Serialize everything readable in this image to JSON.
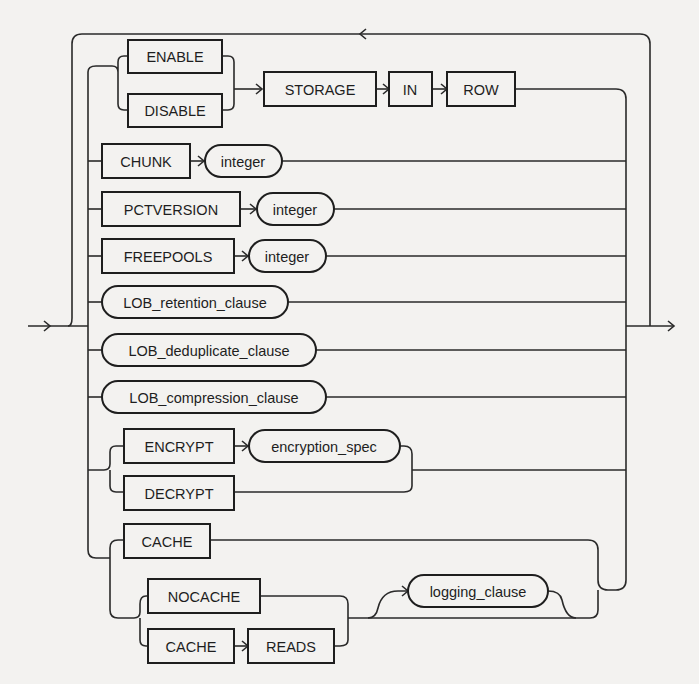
{
  "diagram": {
    "type": "railroad-syntax-diagram",
    "colors": {
      "background": "#f3f2f0",
      "line": "#2a2a2a",
      "text": "#1e1e1e"
    },
    "nodes": {
      "enable": {
        "label": "ENABLE",
        "kind": "keyword"
      },
      "disable": {
        "label": "DISABLE",
        "kind": "keyword"
      },
      "storage": {
        "label": "STORAGE",
        "kind": "keyword"
      },
      "in": {
        "label": "IN",
        "kind": "keyword"
      },
      "row": {
        "label": "ROW",
        "kind": "keyword"
      },
      "chunk": {
        "label": "CHUNK",
        "kind": "keyword"
      },
      "chunk_integer": {
        "label": "integer",
        "kind": "parameter"
      },
      "pctversion": {
        "label": "PCTVERSION",
        "kind": "keyword"
      },
      "pctversion_integer": {
        "label": "integer",
        "kind": "parameter"
      },
      "freepools": {
        "label": "FREEPOOLS",
        "kind": "keyword"
      },
      "freepools_integer": {
        "label": "integer",
        "kind": "parameter"
      },
      "lob_retention_clause": {
        "label": "LOB_retention_clause",
        "kind": "parameter"
      },
      "lob_deduplicate_clause": {
        "label": "LOB_deduplicate_clause",
        "kind": "parameter"
      },
      "lob_compression_clause": {
        "label": "LOB_compression_clause",
        "kind": "parameter"
      },
      "encrypt": {
        "label": "ENCRYPT",
        "kind": "keyword"
      },
      "encryption_spec": {
        "label": "encryption_spec",
        "kind": "parameter"
      },
      "decrypt": {
        "label": "DECRYPT",
        "kind": "keyword"
      },
      "cache": {
        "label": "CACHE",
        "kind": "keyword"
      },
      "nocache": {
        "label": "NOCACHE",
        "kind": "keyword"
      },
      "cache2": {
        "label": "CACHE",
        "kind": "keyword"
      },
      "reads": {
        "label": "READS",
        "kind": "keyword"
      },
      "logging_clause": {
        "label": "logging_clause",
        "kind": "parameter"
      }
    }
  }
}
